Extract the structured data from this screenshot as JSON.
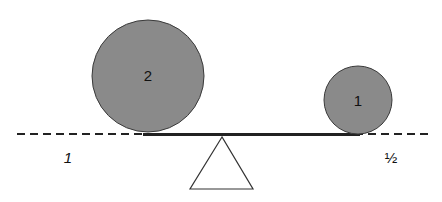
{
  "diagram": {
    "type": "balance-lever",
    "colors": {
      "circle_fill": "#8a8a8a",
      "stroke": "#333333",
      "beam": "#222222",
      "background": "#ffffff"
    },
    "large_circle": {
      "label": "2",
      "cx": 148,
      "cy": 76,
      "r": 56
    },
    "small_circle": {
      "label": "1",
      "cx": 358,
      "cy": 100,
      "r": 34
    },
    "left_distance_label": "1",
    "right_distance_label": "½",
    "fulcrum": "triangle"
  }
}
